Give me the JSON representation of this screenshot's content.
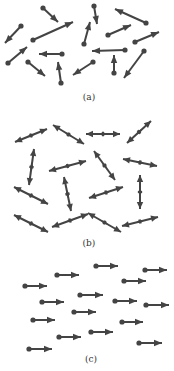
{
  "colors": {
    "arrow": "#444444",
    "background": "#ffffff",
    "label": "#333333"
  },
  "panels": [
    {
      "label": "(a)",
      "label_pos": [
        89,
        100
      ],
      "kind": "single-dot",
      "arrows": [
        [
          43,
          8,
          58,
          22
        ],
        [
          33,
          40,
          73,
          22
        ],
        [
          21,
          26,
          5,
          43
        ],
        [
          94,
          6,
          97,
          24
        ],
        [
          84,
          44,
          90,
          22
        ],
        [
          146,
          23,
          115,
          9
        ],
        [
          108,
          35,
          131,
          25
        ],
        [
          135,
          42,
          159,
          32
        ],
        [
          8,
          63,
          27,
          47
        ],
        [
          62,
          54,
          39,
          54
        ],
        [
          125,
          50,
          92,
          51
        ],
        [
          28,
          62,
          45,
          76
        ],
        [
          61,
          83,
          58,
          62
        ],
        [
          93,
          62,
          73,
          75
        ],
        [
          114,
          73,
          114,
          55
        ],
        [
          144,
          51,
          124,
          78
        ]
      ]
    },
    {
      "label": "(b)",
      "label_pos": [
        89,
        246
      ],
      "kind": "double",
      "arrows": [
        [
          15,
          142,
          47,
          129
        ],
        [
          53,
          125,
          84,
          144
        ],
        [
          86,
          134,
          120,
          134
        ],
        [
          127,
          143,
          151,
          121
        ],
        [
          34,
          149,
          29,
          185
        ],
        [
          49,
          171,
          86,
          161
        ],
        [
          94,
          151,
          115,
          180
        ],
        [
          123,
          159,
          157,
          166
        ],
        [
          64,
          177,
          71,
          211
        ],
        [
          14,
          187,
          48,
          204
        ],
        [
          89,
          198,
          123,
          187
        ],
        [
          140,
          175,
          140,
          209
        ],
        [
          14,
          215,
          48,
          232
        ],
        [
          52,
          227,
          88,
          214
        ],
        [
          88,
          213,
          121,
          232
        ],
        [
          122,
          226,
          158,
          217
        ]
      ]
    },
    {
      "label": "(c)",
      "label_pos": [
        91,
        362
      ],
      "kind": "single-dot",
      "arrows": [
        [
          96,
          266,
          118,
          266
        ],
        [
          145,
          270,
          167,
          270
        ],
        [
          57,
          275,
          79,
          275
        ],
        [
          124,
          281,
          146,
          281
        ],
        [
          25,
          286,
          47,
          286
        ],
        [
          80,
          295,
          103,
          295
        ],
        [
          42,
          302,
          64,
          302
        ],
        [
          115,
          301,
          137,
          301
        ],
        [
          146,
          305,
          169,
          305
        ],
        [
          74,
          312,
          96,
          312
        ],
        [
          33,
          320,
          55,
          320
        ],
        [
          122,
          322,
          143,
          322
        ],
        [
          91,
          332,
          113,
          332
        ],
        [
          59,
          337,
          81,
          337
        ],
        [
          139,
          343,
          162,
          343
        ],
        [
          29,
          349,
          52,
          349
        ]
      ]
    }
  ]
}
